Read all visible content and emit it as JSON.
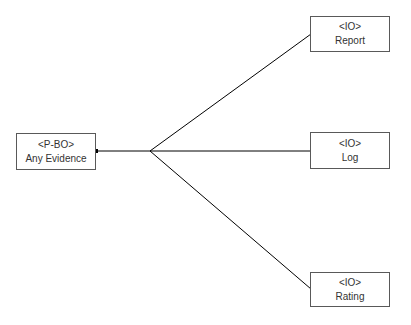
{
  "diagram": {
    "source": {
      "id": "any-evidence",
      "stereotype": "<P-BO>",
      "label": "Any Evidence"
    },
    "targets": [
      {
        "id": "report",
        "stereotype": "<IO>",
        "label": "Report"
      },
      {
        "id": "log",
        "stereotype": "<IO>",
        "label": "Log"
      },
      {
        "id": "rating",
        "stereotype": "<IO>",
        "label": "Rating"
      }
    ],
    "colors": {
      "line": "#000000",
      "border": "#595959",
      "text": "#333333"
    }
  }
}
